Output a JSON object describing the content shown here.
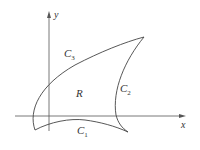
{
  "diagram": {
    "axes": {
      "x_label": "x",
      "y_label": "y",
      "color": "#555555"
    },
    "region": {
      "label": "R",
      "stroke_color": "#444444"
    },
    "curves": [
      {
        "name": "C",
        "subscript": "1",
        "position": "bottom"
      },
      {
        "name": "C",
        "subscript": "2",
        "position": "right"
      },
      {
        "name": "C",
        "subscript": "3",
        "position": "top"
      }
    ]
  }
}
